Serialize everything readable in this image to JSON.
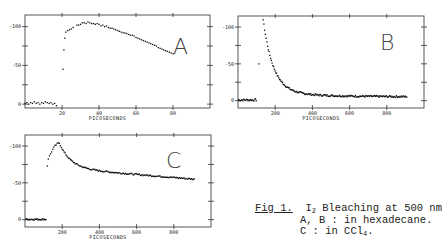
{
  "figure": {
    "caption": {
      "fig_label": "Fig 1.",
      "line1_prefix": "I",
      "line1_sub": "2",
      "line1_rest": " Bleaching at 500 nm",
      "line2": "A, B : in hexadecane.",
      "line3_prefix": "C : in CCl",
      "line3_sub": "4",
      "line3_rest": "."
    }
  },
  "chart_data": [
    {
      "type": "scatter",
      "panel": "A",
      "xlabel": "PICOSECONDS",
      "ylabel": "",
      "xlim": [
        0,
        100
      ],
      "ylim": [
        -5,
        115
      ],
      "xticks": [
        20,
        40,
        60,
        80
      ],
      "xtick_labels": [
        "20",
        "40",
        "60",
        "80"
      ],
      "yticks": [
        0,
        50,
        100
      ],
      "ytick_labels": [
        "0",
        "-50",
        "-100"
      ],
      "annotation": "A",
      "series": [
        {
          "name": "bleaching",
          "x": [
            0,
            1,
            2,
            3,
            4,
            5,
            6,
            7,
            8,
            9,
            10,
            11,
            12,
            13,
            14,
            15,
            16,
            17,
            20.5,
            21,
            21.5,
            22,
            23,
            24,
            25,
            26,
            28,
            29,
            30,
            31,
            32,
            33,
            34,
            35,
            36,
            37,
            38,
            39,
            40,
            41,
            42,
            43,
            44,
            45,
            46,
            47,
            48,
            49,
            50,
            51,
            52,
            53,
            54,
            55,
            56,
            57,
            58,
            59,
            60,
            61,
            62,
            63,
            64,
            65,
            66,
            67,
            68,
            69,
            70,
            71,
            72,
            73,
            74,
            75,
            76,
            77,
            78,
            79,
            80
          ],
          "y": [
            1,
            2,
            0,
            2,
            1,
            3,
            1,
            2,
            0,
            2,
            1,
            3,
            2,
            1,
            2,
            0,
            1,
            -2,
            45,
            70,
            85,
            93,
            95,
            96,
            97,
            99,
            102,
            102,
            103,
            105,
            105,
            104,
            106,
            105,
            104,
            104,
            103,
            104,
            103,
            101,
            102,
            100,
            101,
            99,
            98,
            98,
            97,
            96,
            95,
            94,
            93,
            92,
            92,
            91,
            90,
            89,
            89,
            88,
            86,
            85,
            84,
            83,
            82,
            81,
            80,
            79,
            78,
            77,
            76,
            75,
            73,
            72,
            71,
            70,
            69,
            68,
            67,
            66,
            65
          ]
        }
      ]
    },
    {
      "type": "scatter",
      "panel": "B",
      "xlabel": "PICOSECONDS",
      "ylabel": "",
      "xlim": [
        0,
        1000
      ],
      "ylim": [
        -10,
        115
      ],
      "xticks": [
        200,
        400,
        600,
        800
      ],
      "xtick_labels": [
        "200",
        "400",
        "600",
        "800"
      ],
      "yticks": [
        0,
        50,
        100
      ],
      "ytick_labels": [
        "0",
        "-50",
        "-100"
      ],
      "annotation": "B",
      "series": [
        {
          "name": "bleaching",
          "decay": "fast",
          "peak_x": 135,
          "peak_y": 104,
          "baseline": 5
        }
      ]
    },
    {
      "type": "scatter",
      "panel": "C",
      "xlabel": "PICOSECONDS",
      "ylabel": "",
      "xlim": [
        0,
        1000
      ],
      "ylim": [
        -10,
        115
      ],
      "xticks": [
        200,
        400,
        600,
        800
      ],
      "xtick_labels": [
        "200",
        "400",
        "600",
        "800"
      ],
      "yticks": [
        0,
        50,
        100
      ],
      "ytick_labels": [
        "0",
        "-50",
        "-100"
      ],
      "annotation": "C",
      "series": [
        {
          "name": "bleaching",
          "decay": "slow",
          "peak_x": 185,
          "peak_y": 104,
          "plateau": 70,
          "end_y": 55
        }
      ]
    }
  ]
}
